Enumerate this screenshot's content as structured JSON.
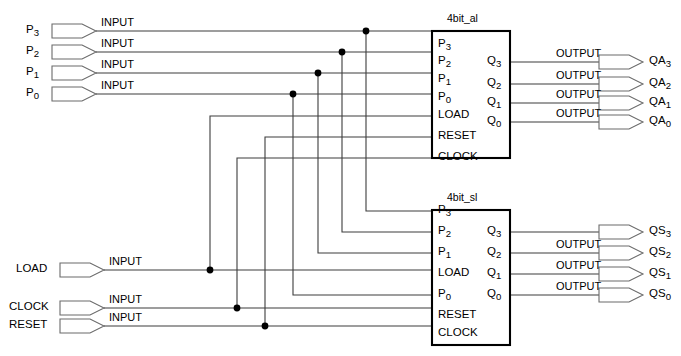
{
  "diagram": {
    "colors": {
      "wire": "#3d3d3d",
      "pin_outline": "#6b6b6b",
      "block_outline": "#000000",
      "junction": "#000000",
      "background": "#ffffff"
    },
    "input_type_label": "INPUT",
    "output_type_label": "OUTPUT",
    "inputs": [
      {
        "name": "P3",
        "base": "P",
        "sub": "3",
        "type_label": "INPUT",
        "y": 31
      },
      {
        "name": "P2",
        "base": "P",
        "sub": "2",
        "type_label": "INPUT",
        "y": 52
      },
      {
        "name": "P1",
        "base": "P",
        "sub": "1",
        "type_label": "INPUT",
        "y": 73
      },
      {
        "name": "P0",
        "base": "P",
        "sub": "0",
        "type_label": "INPUT",
        "y": 94
      },
      {
        "name": "LOAD",
        "base": "LOAD",
        "sub": "",
        "type_label": "INPUT",
        "y": 270
      },
      {
        "name": "CLOCK",
        "base": "CLOCK",
        "sub": "",
        "type_label": "INPUT",
        "y": 308
      },
      {
        "name": "RESET",
        "base": "RESET",
        "sub": "",
        "type_label": "INPUT",
        "y": 326
      }
    ],
    "outputs": [
      {
        "name": "QA3",
        "base": "QA",
        "sub": "3",
        "type_label": "OUTPUT",
        "y": 62
      },
      {
        "name": "QA2",
        "base": "QA",
        "sub": "2",
        "type_label": "OUTPUT",
        "y": 84
      },
      {
        "name": "QA1",
        "base": "QA",
        "sub": "1",
        "type_label": "OUTPUT",
        "y": 103
      },
      {
        "name": "QA0",
        "base": "QA",
        "sub": "0",
        "type_label": "OUTPUT",
        "y": 122
      },
      {
        "name": "QS3",
        "base": "QS",
        "sub": "3",
        "type_label": "",
        "y": 232
      },
      {
        "name": "QS2",
        "base": "QS",
        "sub": "2",
        "type_label": "OUTPUT",
        "y": 253
      },
      {
        "name": "QS1",
        "base": "QS",
        "sub": "1",
        "type_label": "OUTPUT",
        "y": 274
      },
      {
        "name": "QS0",
        "base": "QS",
        "sub": "0",
        "type_label": "OUTPUT",
        "y": 295
      }
    ],
    "blocks": [
      {
        "id": "block_a",
        "title": "4bit_al",
        "x": 432,
        "y": 31,
        "w": 78,
        "h": 127,
        "inputs": [
          {
            "label": "P3",
            "base": "P",
            "sub": "3",
            "y": 45
          },
          {
            "label": "P2",
            "base": "P",
            "sub": "2",
            "y": 62
          },
          {
            "label": "P1",
            "base": "P",
            "sub": "1",
            "y": 80
          },
          {
            "label": "P0",
            "base": "P",
            "sub": "0",
            "y": 98
          },
          {
            "label": "LOAD",
            "base": "LOAD",
            "sub": "",
            "y": 116
          },
          {
            "label": "RESET",
            "base": "RESET",
            "sub": "",
            "y": 137
          },
          {
            "label": "CLOCK",
            "base": "CLOCK",
            "sub": "",
            "y": 158
          }
        ],
        "outputs": [
          {
            "label": "Q3",
            "base": "Q",
            "sub": "3",
            "y": 62
          },
          {
            "label": "Q2",
            "base": "Q",
            "sub": "2",
            "y": 84
          },
          {
            "label": "Q1",
            "base": "Q",
            "sub": "1",
            "y": 103
          },
          {
            "label": "Q0",
            "base": "Q",
            "sub": "0",
            "y": 122
          }
        ]
      },
      {
        "id": "block_s",
        "title": "4bit_sl",
        "x": 432,
        "y": 210,
        "w": 78,
        "h": 135,
        "inputs": [
          {
            "label": "P3",
            "base": "P",
            "sub": "3",
            "y": 211
          },
          {
            "label": "P2",
            "base": "P",
            "sub": "2",
            "y": 232
          },
          {
            "label": "P1",
            "base": "P",
            "sub": "1",
            "y": 253
          },
          {
            "label": "LOAD",
            "base": "LOAD",
            "sub": "",
            "y": 274
          },
          {
            "label": "P0",
            "base": "P",
            "sub": "0",
            "y": 295
          },
          {
            "label": "RESET",
            "base": "RESET",
            "sub": "",
            "y": 316
          },
          {
            "label": "CLOCK",
            "base": "CLOCK",
            "sub": "",
            "y": 334
          }
        ],
        "outputs": [
          {
            "label": "Q3",
            "base": "Q",
            "sub": "3",
            "y": 232
          },
          {
            "label": "Q2",
            "base": "Q",
            "sub": "2",
            "y": 253
          },
          {
            "label": "Q1",
            "base": "Q",
            "sub": "1",
            "y": 274
          },
          {
            "label": "Q0",
            "base": "Q",
            "sub": "0",
            "y": 295
          }
        ]
      }
    ],
    "junctions": [
      {
        "net": "P3",
        "x": 366,
        "y": 31
      },
      {
        "net": "P2",
        "x": 342,
        "y": 52
      },
      {
        "net": "P1",
        "x": 318,
        "y": 73
      },
      {
        "net": "P0",
        "x": 293,
        "y": 94
      },
      {
        "net": "LOAD",
        "x": 210,
        "y": 270
      },
      {
        "net": "CLOCK",
        "x": 237,
        "y": 308
      },
      {
        "net": "RESET",
        "x": 265,
        "y": 326
      }
    ],
    "nets": [
      {
        "name": "P3",
        "from": "P3-input",
        "to": [
          "block_a.P3",
          "block_s.P3"
        ]
      },
      {
        "name": "P2",
        "from": "P2-input",
        "to": [
          "block_a.P2",
          "block_s.P2"
        ]
      },
      {
        "name": "P1",
        "from": "P1-input",
        "to": [
          "block_a.P1",
          "block_s.P1"
        ]
      },
      {
        "name": "P0",
        "from": "P0-input",
        "to": [
          "block_a.P0",
          "block_s.P0"
        ]
      },
      {
        "name": "LOAD",
        "from": "LOAD-input",
        "to": [
          "block_a.LOAD",
          "block_s.LOAD"
        ]
      },
      {
        "name": "RESET",
        "from": "RESET-input",
        "to": [
          "block_a.RESET",
          "block_s.RESET"
        ]
      },
      {
        "name": "CLOCK",
        "from": "CLOCK-input",
        "to": [
          "block_a.CLOCK",
          "block_s.CLOCK"
        ]
      },
      {
        "name": "QA3",
        "from": "block_a.Q3",
        "to": [
          "QA3-output"
        ]
      },
      {
        "name": "QA2",
        "from": "block_a.Q2",
        "to": [
          "QA2-output"
        ]
      },
      {
        "name": "QA1",
        "from": "block_a.Q1",
        "to": [
          "QA1-output"
        ]
      },
      {
        "name": "QA0",
        "from": "block_a.Q0",
        "to": [
          "QA0-output"
        ]
      },
      {
        "name": "QS3",
        "from": "block_s.Q3",
        "to": [
          "QS3-output"
        ]
      },
      {
        "name": "QS2",
        "from": "block_s.Q2",
        "to": [
          "QS2-output"
        ]
      },
      {
        "name": "QS1",
        "from": "block_s.Q1",
        "to": [
          "QS1-output"
        ]
      },
      {
        "name": "QS0",
        "from": "block_s.Q0",
        "to": [
          "QS0-output"
        ]
      }
    ]
  }
}
